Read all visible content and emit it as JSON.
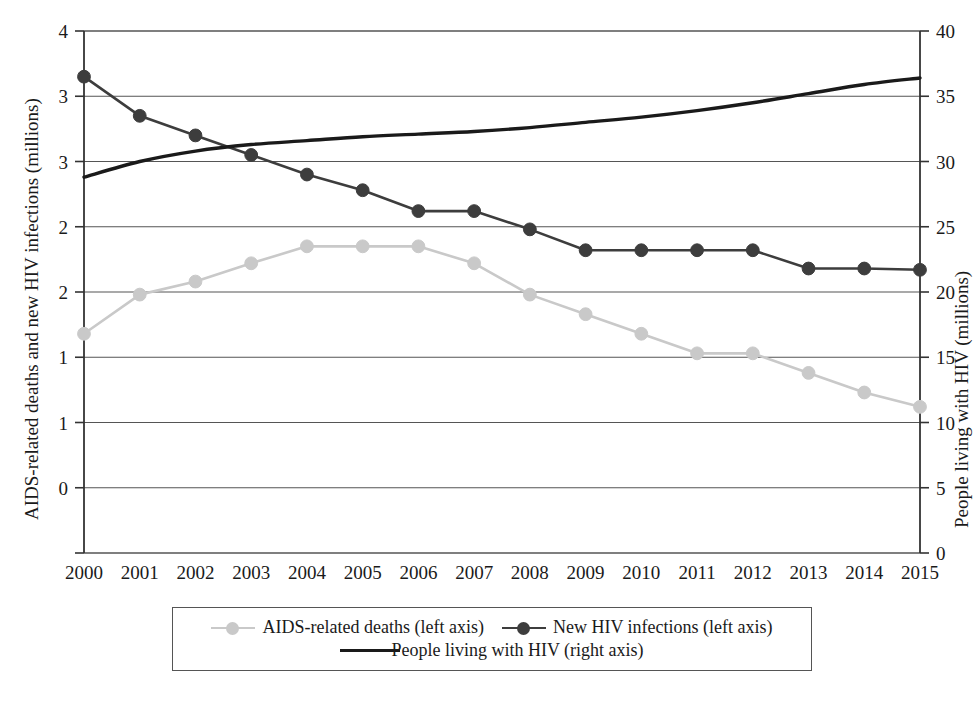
{
  "chart_data": {
    "type": "line",
    "title": "",
    "subtitle": "",
    "xlabel": "",
    "ylabel": "AIDS-related deaths and new HIV infections (millions)",
    "ylabel_right": "People living with HIV (millions)",
    "grid": true,
    "legend_position": "bottom",
    "x": [
      2000,
      2001,
      2002,
      2003,
      2004,
      2005,
      2006,
      2007,
      2008,
      2009,
      2010,
      2011,
      2012,
      2013,
      2014,
      2015
    ],
    "categories": [
      "2000",
      "2001",
      "2002",
      "2003",
      "2004",
      "2005",
      "2006",
      "2007",
      "2008",
      "2009",
      "2010",
      "2011",
      "2012",
      "2013",
      "2014",
      "2015"
    ],
    "ylim": [
      0,
      4
    ],
    "yticks": [
      0,
      0.5,
      1,
      1.5,
      2,
      2.5,
      3,
      3.5,
      4
    ],
    "ytick_labels": [
      "0",
      "1",
      "1",
      "2",
      "2",
      "3",
      "3",
      "4"
    ],
    "ytick_labels_shown": [
      "4",
      "3",
      "3",
      "2",
      "2",
      "1",
      "1",
      "0"
    ],
    "ylim_right": [
      0,
      40
    ],
    "yticks_right": [
      0,
      5,
      10,
      15,
      20,
      25,
      30,
      35,
      40
    ],
    "ytick_labels_right": [
      "40",
      "35",
      "30",
      "25",
      "20",
      "15",
      "10",
      "5",
      "0"
    ],
    "series": [
      {
        "name": "AIDS-related deaths (left axis)",
        "axis": "left",
        "color": "#c9c9c9",
        "marker": "circle",
        "values": [
          1.68,
          1.98,
          2.08,
          2.22,
          2.35,
          2.35,
          2.35,
          2.22,
          1.98,
          1.83,
          1.68,
          1.53,
          1.53,
          1.38,
          1.23,
          1.12
        ]
      },
      {
        "name": "New HIV infections (left axis)",
        "axis": "left",
        "color": "#3d3d3d",
        "marker": "circle",
        "values": [
          3.65,
          3.35,
          3.2,
          3.05,
          2.9,
          2.78,
          2.62,
          2.62,
          2.48,
          2.32,
          2.32,
          2.32,
          2.32,
          2.18,
          2.18,
          2.17
        ]
      },
      {
        "name": "People living with HIV (right axis)",
        "axis": "right",
        "color": "#1a1a1a",
        "marker": "none",
        "values": [
          28.8,
          30.0,
          30.8,
          31.3,
          31.6,
          31.9,
          32.1,
          32.3,
          32.6,
          33.0,
          33.4,
          33.9,
          34.5,
          35.2,
          35.9,
          36.4
        ]
      }
    ]
  },
  "legend": {
    "items": [
      {
        "label": "AIDS-related deaths (left axis)",
        "color": "#c9c9c9",
        "marker": true
      },
      {
        "label": "New HIV infections (left axis)",
        "color": "#3d3d3d",
        "marker": true
      },
      {
        "label": "People living with HIV (right axis)",
        "color": "#1a1a1a",
        "marker": false
      }
    ]
  },
  "axis_titles": {
    "left": "AIDS-related deaths and new HIV infections (millions)",
    "right": "People living with HIV (millions)"
  }
}
